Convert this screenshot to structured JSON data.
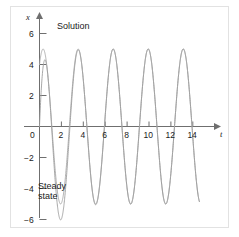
{
  "chart_data": {
    "type": "line",
    "title": "",
    "xlabel": "t",
    "ylabel": "x",
    "xlim": [
      -1.2,
      15.6
    ],
    "ylim": [
      -7.2,
      7.6
    ],
    "grid": false,
    "legend_position": "inline-annotations",
    "xticks": [
      0,
      2,
      4,
      6,
      8,
      10,
      12,
      14
    ],
    "xtick_labels": [
      "0",
      "2",
      "4",
      "6",
      "8",
      "10",
      "12",
      "14"
    ],
    "yticks": [
      -6,
      -4,
      -2,
      2,
      4,
      6
    ],
    "ytick_labels": [
      "−6",
      "−4",
      "−2",
      "2",
      "4",
      "6"
    ],
    "annotations": [
      {
        "text": "Solution",
        "x": 2.6,
        "y": 6.6
      },
      {
        "text": "Steady state",
        "x": 0.35,
        "y": -4.7
      }
    ],
    "series": [
      {
        "name": "Steady state",
        "color": "#a8a8a8",
        "description": "Undamped sinusoid of amplitude 5 and period about 3.2",
        "amplitude": 5,
        "period": 3.2,
        "phase_deg": 53,
        "x_start": 0,
        "x_end": 14.6,
        "y_at_x0": 4.0
      },
      {
        "name": "Solution",
        "color": "#9e9e9e",
        "description": "Steady state plus decaying transient; starts at zero, first peak near 7, converges onto steady state",
        "amplitude": 5,
        "period": 3.2,
        "phase_deg": 53,
        "transient_amplitude": 4.0,
        "transient_decay_rate": 0.95,
        "x_start": 0,
        "x_end": 14.6,
        "y_at_x0": 0,
        "first_peak": {
          "x": 1.45,
          "y": 7.0
        }
      }
    ]
  }
}
